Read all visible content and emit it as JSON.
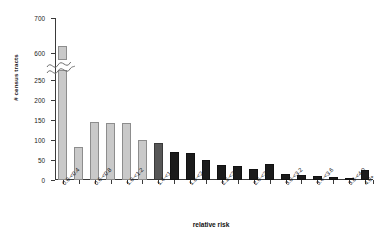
{
  "chart_data": {
    "type": "bar",
    "title": "",
    "xlabel": "relative risk",
    "ylabel": "# census tracts",
    "categories": [
      "0.0-<0.4",
      "0.4-<0.6",
      "0.6-<0.8",
      "0.8-<1.0",
      "1.0-<1.2",
      "1.2-<1.4",
      "1.4-<1.6",
      "1.6-<1.8",
      "1.8-<2.0",
      "2.0-<2.2",
      "2.2-<2.4",
      "2.4-<2.6",
      "2.6-<2.8",
      "2.8-<3.0",
      "3.0-<3.2",
      "3.2-<3.4",
      "3.4-<3.6",
      "3.6-<3.8",
      "3.8-<4.0",
      "4.0+"
    ],
    "values": [
      620,
      83,
      145,
      142,
      142,
      100,
      93,
      70,
      68,
      50,
      38,
      35,
      28,
      40,
      15,
      13,
      9,
      8,
      5,
      25
    ],
    "bar_styles": [
      "light",
      "light",
      "light",
      "light",
      "light",
      "light",
      "mid",
      "dark",
      "dark",
      "dark",
      "dark",
      "dark",
      "dark",
      "dark",
      "dark",
      "dark",
      "dark",
      "dark",
      "dark",
      "dark"
    ],
    "visible_tick_labels": [
      "0.0-<0.4",
      "0.6-<0.8",
      "1.0-<1.2",
      "1.4-<1.6",
      "1.8-<2.0",
      "2.2-<2.4",
      "2.6-<2.8",
      "3.0-<3.2",
      "3.4-<3.6",
      "3.8-<4.0",
      "4.0+"
    ],
    "visible_tick_indices": [
      0,
      2,
      4,
      6,
      8,
      10,
      12,
      14,
      16,
      18,
      19
    ],
    "y_ticks_lower": [
      0,
      50,
      100,
      150,
      200,
      250
    ],
    "y_ticks_upper": [
      600,
      700
    ],
    "y_axis_break": true,
    "ylim_lower": [
      0,
      250
    ],
    "ylim_upper": [
      580,
      700
    ],
    "grid": false,
    "legend": "none",
    "colors": {
      "light_bar": "#c9c9c9",
      "light_bar_edge": "#8d8d8d",
      "mid_bar": "#575757",
      "dark_bar": "#1b1b1b",
      "axis": "#3a3a3a",
      "text": "#1a1a1a",
      "background": "#ffffff"
    }
  }
}
